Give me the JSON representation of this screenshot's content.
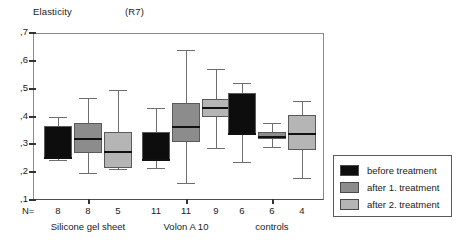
{
  "title": {
    "measure": "Elasticity",
    "code": "(R7)"
  },
  "axis": {
    "y_ticks": [
      ",7",
      ",6",
      ",5",
      ",4",
      ",3",
      ",2",
      ",1"
    ],
    "y_values": [
      0.7,
      0.6,
      0.5,
      0.4,
      0.3,
      0.2,
      0.1
    ],
    "n_prefix": "N="
  },
  "legend": {
    "items": [
      {
        "label": "before  treatment",
        "color": "#0d0d0d"
      },
      {
        "label": "after 1. treatment",
        "color": "#8c8c8c"
      },
      {
        "label": "after 2. treatment",
        "color": "#b5b5b5"
      }
    ]
  },
  "groups": [
    {
      "label": "Silicone gel sheet",
      "counts": [
        "8",
        "8",
        "5"
      ]
    },
    {
      "label": "Volon A 10",
      "counts": [
        "11",
        "11",
        "9"
      ]
    },
    {
      "label": "controls",
      "counts": [
        "6",
        "6",
        "4"
      ]
    }
  ],
  "chart_data": {
    "type": "box",
    "title": "Elasticity (R7)",
    "xlabel": "",
    "ylabel": "Elasticity",
    "ylim": [
      0.1,
      0.7
    ],
    "ytick_labels": [
      ",1",
      ",2",
      ",3",
      ",4",
      ",5",
      ",6",
      ",7"
    ],
    "grid": false,
    "legend_position": "right-bottom",
    "categories": [
      "Silicone gel sheet",
      "Volon A 10",
      "controls"
    ],
    "series": [
      {
        "name": "before  treatment",
        "color": "#0d0d0d",
        "boxes": [
          {
            "category": "Silicone gel sheet",
            "n": 8,
            "whisker_low": 0.245,
            "q1": 0.25,
            "median": 0.252,
            "q3": 0.365,
            "whisker_high": 0.4
          },
          {
            "category": "Volon A 10",
            "n": 11,
            "whisker_low": 0.215,
            "q1": 0.24,
            "median": 0.242,
            "q3": 0.345,
            "whisker_high": 0.43
          },
          {
            "category": "controls",
            "n": 6,
            "whisker_low": 0.235,
            "q1": 0.335,
            "median": 0.337,
            "q3": 0.485,
            "whisker_high": 0.52
          }
        ]
      },
      {
        "name": "after 1. treatment",
        "color": "#8c8c8c",
        "boxes": [
          {
            "category": "Silicone gel sheet",
            "n": 8,
            "whisker_low": 0.198,
            "q1": 0.268,
            "median": 0.32,
            "q3": 0.375,
            "whisker_high": 0.468
          },
          {
            "category": "Volon A 10",
            "n": 11,
            "whisker_low": 0.162,
            "q1": 0.31,
            "median": 0.363,
            "q3": 0.45,
            "whisker_high": 0.64
          },
          {
            "category": "controls",
            "n": 6,
            "whisker_low": 0.29,
            "q1": 0.318,
            "median": 0.325,
            "q3": 0.345,
            "whisker_high": 0.375
          }
        ]
      },
      {
        "name": "after 2. treatment",
        "color": "#b5b5b5",
        "boxes": [
          {
            "category": "Silicone gel sheet",
            "n": 5,
            "whisker_low": 0.213,
            "q1": 0.215,
            "median": 0.272,
            "q3": 0.345,
            "whisker_high": 0.497
          },
          {
            "category": "Volon A 10",
            "n": 9,
            "whisker_low": 0.288,
            "q1": 0.398,
            "median": 0.43,
            "q3": 0.462,
            "whisker_high": 0.572
          },
          {
            "category": "controls",
            "n": 4,
            "whisker_low": 0.18,
            "q1": 0.28,
            "median": 0.338,
            "q3": 0.405,
            "whisker_high": 0.455
          }
        ]
      }
    ]
  }
}
